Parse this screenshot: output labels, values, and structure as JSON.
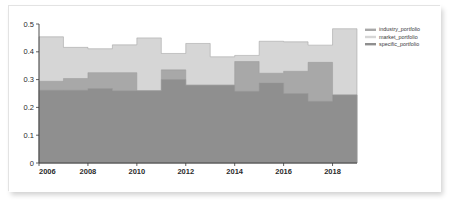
{
  "chart_data": {
    "type": "area",
    "subtype": "stacked-step-area",
    "title": "",
    "xlabel": "",
    "ylabel": "",
    "xlim": [
      2006,
      2019
    ],
    "ylim": [
      0,
      0.5
    ],
    "grid": false,
    "legend_position": "right-top",
    "x_tick_labels": [
      "2006",
      "2008",
      "2010",
      "2012",
      "2014",
      "2016",
      "2018"
    ],
    "x_ticks": [
      2006,
      2008,
      2010,
      2012,
      2014,
      2016,
      2018
    ],
    "y_tick_labels": [
      "0",
      "0.1",
      "0.2",
      "0.3",
      "0.4",
      "0.5"
    ],
    "y_ticks": [
      0,
      0.1,
      0.2,
      0.3,
      0.4,
      0.5
    ],
    "x": [
      2006,
      2007,
      2008,
      2009,
      2010,
      2011,
      2012,
      2013,
      2014,
      2015,
      2016,
      2017,
      2018
    ],
    "series": [
      {
        "name": "specific_portfolio",
        "color": "#8f8f8f",
        "values": [
          0.262,
          0.262,
          0.268,
          0.26,
          0.26,
          0.3,
          0.28,
          0.28,
          0.258,
          0.288,
          0.25,
          0.222,
          0.245
        ]
      },
      {
        "name": "industry_portfolio",
        "color": "#a8a8a8",
        "values": [
          0.032,
          0.042,
          0.057,
          0.065,
          0.0,
          0.035,
          0.0,
          0.0,
          0.107,
          0.035,
          0.08,
          0.14,
          0.0
        ]
      },
      {
        "name": "market_portfolio",
        "color": "#d6d6d6",
        "values": [
          0.16,
          0.112,
          0.086,
          0.1,
          0.19,
          0.059,
          0.15,
          0.102,
          0.022,
          0.115,
          0.106,
          0.062,
          0.238
        ]
      }
    ],
    "stack_tops": {
      "specific_portfolio": [
        0.262,
        0.262,
        0.268,
        0.26,
        0.26,
        0.3,
        0.28,
        0.28,
        0.258,
        0.288,
        0.25,
        0.222,
        0.245
      ],
      "industry_portfolio": [
        0.294,
        0.304,
        0.325,
        0.325,
        0.26,
        0.335,
        0.28,
        0.28,
        0.365,
        0.323,
        0.33,
        0.362,
        0.245
      ],
      "market_portfolio": [
        0.454,
        0.416,
        0.411,
        0.425,
        0.45,
        0.394,
        0.43,
        0.382,
        0.387,
        0.438,
        0.436,
        0.424,
        0.483
      ]
    }
  },
  "legend": {
    "entries": [
      {
        "label": "industry_portfolio",
        "color": "#a8a8a8"
      },
      {
        "label": "market_portfolio",
        "color": "#d6d6d6"
      },
      {
        "label": "specific_portfolio",
        "color": "#8f8f8f"
      }
    ]
  },
  "axes": {
    "axis_color": "#3a3a3a"
  }
}
